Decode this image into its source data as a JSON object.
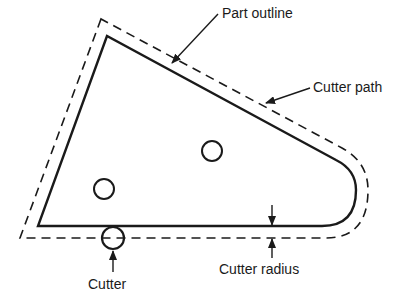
{
  "diagram": {
    "type": "cutter-path-offset",
    "labels": {
      "part_outline": "Part outline",
      "cutter_path": "Cutter path",
      "cutter": "Cutter",
      "cutter_radius": "Cutter radius"
    },
    "elements": {
      "part_outline": {
        "style": "solid"
      },
      "cutter_path": {
        "style": "dashed"
      },
      "holes": [
        {
          "cx": 212,
          "cy": 151,
          "r": 10
        },
        {
          "cx": 104,
          "cy": 189,
          "r": 10
        }
      ],
      "cutter": {
        "cx": 113,
        "cy": 238,
        "r": 11
      }
    },
    "colors": {
      "line": "#1a1a1a",
      "background": "#ffffff"
    }
  }
}
